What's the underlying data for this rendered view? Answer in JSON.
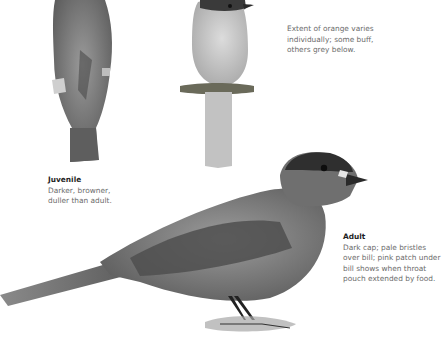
{
  "illustrations": [
    {
      "id": "juvenile-back",
      "label": "juvenile bird, back view"
    },
    {
      "id": "pale-front",
      "label": "bird, front view, pale underparts on perch"
    },
    {
      "id": "adult-side",
      "label": "adult bird, side view standing on ground"
    }
  ],
  "captions": {
    "variation": {
      "title": "",
      "body": "Extent of orange varies\nindividually; some buff,\nothers grey below."
    },
    "juvenile": {
      "title": "Juvenile",
      "body": "Darker, browner,\nduller than adult."
    },
    "adult": {
      "title": "Adult",
      "body": "Dark cap; pale bristles\nover bill; pink patch under\nbill shows when throat\npouch extended by food."
    }
  },
  "colors": {
    "background": "#ffffff",
    "caption_title": "#1f1f1f",
    "caption_body": "#6b6b6b",
    "bird_dark": "#3a3a3a",
    "bird_mid": "#6e6e6e",
    "bird_light": "#b9b9b9"
  }
}
